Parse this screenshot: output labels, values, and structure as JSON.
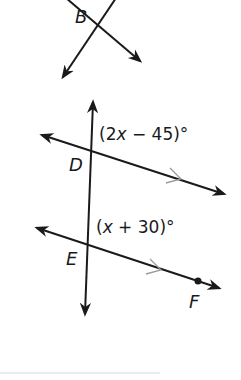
{
  "diagram": {
    "points": {
      "B": "B",
      "D": "D",
      "E": "E",
      "F": "F"
    },
    "angles": {
      "upper": {
        "open": "(2",
        "var": "x",
        "rest": " − 45)°"
      },
      "lower": {
        "open": "(",
        "var": "x",
        "rest": " + 30)°"
      }
    },
    "colors": {
      "line": "#1a1a1a",
      "parallel_marker": "#9a9a9a"
    }
  }
}
